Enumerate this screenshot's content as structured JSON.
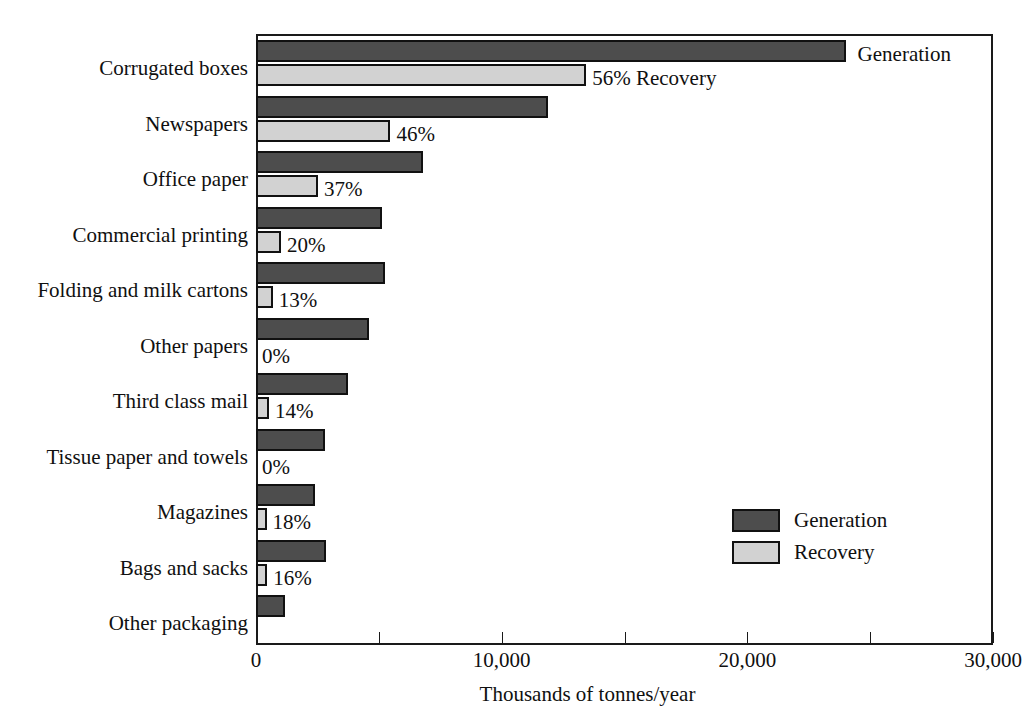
{
  "chart_data": {
    "type": "bar",
    "orientation": "horizontal",
    "title": "",
    "xlabel": "Thousands of tonnes/year",
    "ylabel": "",
    "xlim": [
      0,
      30000
    ],
    "xticks": [
      0,
      10000,
      20000,
      30000
    ],
    "xticklabels": [
      "0",
      "10,000",
      "20,000",
      "30,000"
    ],
    "minor_tick_interval": 5000,
    "grid": false,
    "legend_position": "center right",
    "categories": [
      "Corrugated boxes",
      "Newspapers",
      "Office paper",
      "Commercial printing",
      "Folding and milk cartons",
      "Other papers",
      "Third class mail",
      "Tissue paper and towels",
      "Magazines",
      "Bags and sacks",
      "Other packaging"
    ],
    "series": [
      {
        "name": "Generation",
        "color": "#4d4d4d",
        "values": [
          24000,
          11900,
          6800,
          5120,
          5250,
          4600,
          3750,
          2800,
          2400,
          2850,
          1180
        ]
      },
      {
        "name": "Recovery",
        "color": "#d2d2d2",
        "values": [
          13440,
          5470,
          2520,
          1020,
          680,
          0,
          530,
          0,
          430,
          460,
          0
        ]
      }
    ],
    "recovery_percent_labels": [
      "56% Recovery",
      "46%",
      "37%",
      "20%",
      "13%",
      "0%",
      "14%",
      "0%",
      "18%",
      "16%",
      ""
    ],
    "annotations": [
      {
        "text": "Generation",
        "anchor": "corrugated-generation-bar-end"
      },
      {
        "text": "56% Recovery",
        "anchor": "corrugated-recovery-bar-end"
      }
    ]
  },
  "legend": {
    "items": [
      {
        "label": "Generation",
        "color": "#4d4d4d"
      },
      {
        "label": "Recovery",
        "color": "#d2d2d2"
      }
    ]
  },
  "axis": {
    "x_title": "Thousands of tonnes/year",
    "tick_labels": [
      "0",
      "10,000",
      "20,000",
      "30,000"
    ]
  }
}
